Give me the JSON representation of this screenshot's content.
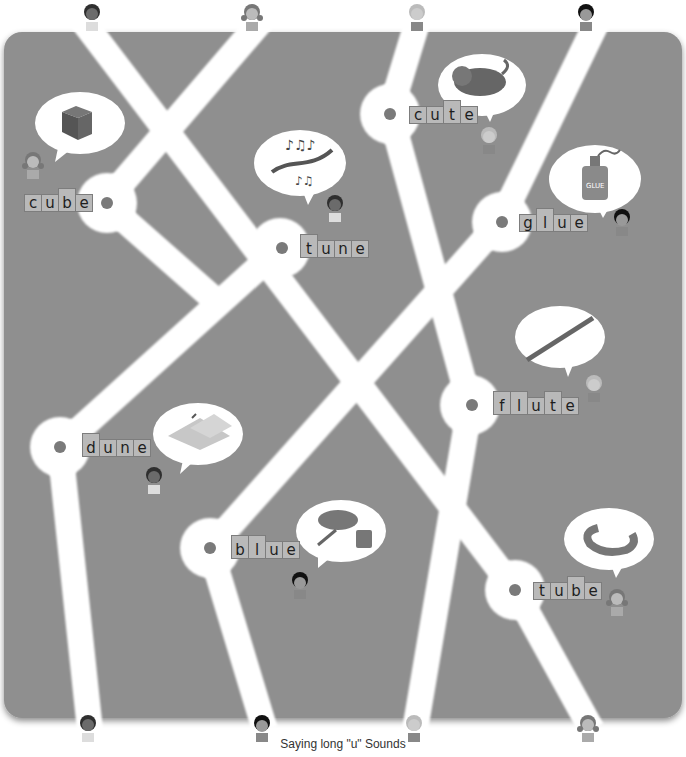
{
  "title": "Saying long \"u\" Sounds",
  "colors": {
    "board": "#8f8f8f",
    "road": "#ffffff",
    "tile": "#b9b9b9",
    "dot": "#7a7a7a"
  },
  "top_kids": [
    {
      "id": "kid-boy-curly",
      "x": 92
    },
    {
      "id": "kid-girl-pigtails",
      "x": 252
    },
    {
      "id": "kid-boy-blond",
      "x": 417
    },
    {
      "id": "kid-girl-bob",
      "x": 586
    }
  ],
  "bottom_kids": [
    {
      "id": "kid-boy-curly",
      "x": 88
    },
    {
      "id": "kid-girl-bob",
      "x": 262
    },
    {
      "id": "kid-boy-blond",
      "x": 414
    },
    {
      "id": "kid-girl-pigtails",
      "x": 588
    }
  ],
  "stops": [
    {
      "word": "cube",
      "picture": "cube",
      "letters": [
        "c",
        "u",
        "b",
        "e"
      ],
      "tall": [
        2
      ]
    },
    {
      "word": "tune",
      "picture": "music-notes",
      "letters": [
        "t",
        "u",
        "n",
        "e"
      ],
      "tall": [
        0
      ]
    },
    {
      "word": "cute",
      "picture": "cat",
      "letters": [
        "c",
        "u",
        "t",
        "e"
      ],
      "tall": [
        2
      ]
    },
    {
      "word": "glue",
      "picture": "glue-bottle",
      "letters": [
        "g",
        "l",
        "u",
        "e"
      ],
      "tall": [
        1
      ]
    },
    {
      "word": "flute",
      "picture": "flute",
      "letters": [
        "f",
        "l",
        "u",
        "t",
        "e"
      ],
      "tall": [
        0,
        1,
        3
      ]
    },
    {
      "word": "dune",
      "picture": "sand-dune",
      "letters": [
        "d",
        "u",
        "n",
        "e"
      ],
      "tall": [
        0
      ]
    },
    {
      "word": "blue",
      "picture": "paint-splash-bucket",
      "letters": [
        "b",
        "l",
        "u",
        "e"
      ],
      "tall": [
        0,
        1
      ]
    },
    {
      "word": "tube",
      "picture": "tube",
      "letters": [
        "t",
        "u",
        "b",
        "e"
      ],
      "tall": [
        2
      ]
    }
  ]
}
